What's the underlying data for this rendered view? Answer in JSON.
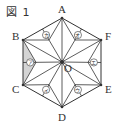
{
  "figure": {
    "title": "図 1",
    "shape": "regular-hexagon-asanoha-pattern",
    "vertices": [
      {
        "name": "A",
        "x": 62,
        "y": 18,
        "label_x": 58,
        "label_y": 13
      },
      {
        "name": "F",
        "x": 101,
        "y": 40,
        "label_x": 105,
        "label_y": 40
      },
      {
        "name": "E",
        "x": 101,
        "y": 85,
        "label_x": 105,
        "label_y": 93
      },
      {
        "name": "D",
        "x": 62,
        "y": 107,
        "label_x": 58,
        "label_y": 121
      },
      {
        "name": "C",
        "x": 23,
        "y": 85,
        "label_x": 12,
        "label_y": 93
      },
      {
        "name": "B",
        "x": 23,
        "y": 40,
        "label_x": 12,
        "label_y": 40
      }
    ],
    "center": {
      "name": "O",
      "x": 62,
      "y": 62,
      "label_x": 64,
      "label_y": 72
    },
    "regions": [
      {
        "label": "ア",
        "shaded": true
      },
      {
        "label": "イ",
        "shaded": false
      },
      {
        "label": "ウ",
        "shaded": false
      },
      {
        "label": "エ",
        "shaded": false
      },
      {
        "label": "オ",
        "shaded": false
      },
      {
        "label": "カ",
        "shaded": false
      }
    ],
    "colors": {
      "line": "#333333",
      "shade": "#d4d4d4",
      "background": "#ffffff"
    }
  }
}
